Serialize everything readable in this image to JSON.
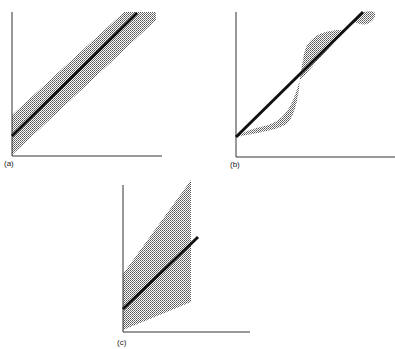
{
  "panels": [
    {
      "id": "a",
      "label": "(a)",
      "description": "Straight line with uniform-width shaded band around it"
    },
    {
      "id": "b",
      "label": "(b)",
      "description": "Straight line with sinusoidally deviating shaded region"
    },
    {
      "id": "c",
      "label": "(c)",
      "description": "Straight line with widening (fan-shaped) shaded band"
    }
  ],
  "colors": {
    "line": "#111111",
    "axis": "#333333",
    "shade": "#8a8a8a"
  }
}
